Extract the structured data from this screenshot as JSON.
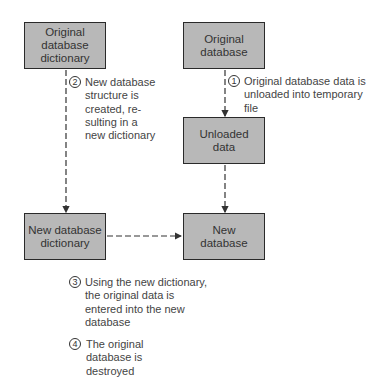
{
  "boxes": {
    "orig_dict": "Original database dictionary",
    "orig_db": "Original database",
    "unloaded": "Unloaded data",
    "new_dict": "New database dictionary",
    "new_db": "New database"
  },
  "steps": [
    {
      "num": "1",
      "text": "Original database data is unloaded into temporary file"
    },
    {
      "num": "2",
      "text": "New database structure is created, re-sulting in a new dictionary"
    },
    {
      "num": "3",
      "text": "Using the new dictionary, the original data is entered into the new database"
    },
    {
      "num": "4",
      "text": "The original database is destroyed"
    }
  ]
}
